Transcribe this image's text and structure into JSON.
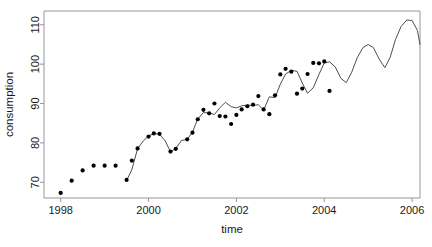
{
  "chart_data": {
    "type": "line",
    "title": "",
    "xlabel": "time",
    "ylabel": "consumption",
    "xlim": [
      1997.6,
      1998.0
    ],
    "xlim_actual": [
      1997.62,
      2006.18
    ],
    "ylim": [
      66.0,
      113.5
    ],
    "grid": false,
    "legend": "none",
    "y_ticks": [
      70,
      80,
      90,
      100,
      110
    ],
    "x_ticks": [
      1998,
      2000,
      2002,
      2004,
      2006
    ],
    "x_tick_labels": [
      "1998",
      "2000",
      "2002",
      "2004",
      "2006"
    ],
    "y_tick_labels": [
      "70",
      "80",
      "90",
      "100",
      "110"
    ],
    "series": [
      {
        "name": "observed",
        "type": "scatter",
        "marker": "filled-circle",
        "color": "#000000",
        "points": [
          [
            1998.0,
            67.3
          ],
          [
            1998.25,
            70.4
          ],
          [
            1998.5,
            73.0
          ],
          [
            1998.75,
            74.2
          ],
          [
            1999.0,
            74.2
          ],
          [
            1999.25,
            74.2
          ],
          [
            1999.5,
            70.6
          ],
          [
            1999.62,
            75.5
          ],
          [
            1999.75,
            78.6
          ],
          [
            2000.0,
            81.6
          ],
          [
            2000.12,
            82.4
          ],
          [
            2000.25,
            82.3
          ],
          [
            2000.5,
            77.8
          ],
          [
            2000.62,
            78.5
          ],
          [
            2000.88,
            80.9
          ],
          [
            2001.0,
            82.6
          ],
          [
            2001.12,
            86.0
          ],
          [
            2001.25,
            88.4
          ],
          [
            2001.38,
            87.5
          ],
          [
            2001.5,
            90.0
          ],
          [
            2001.62,
            86.8
          ],
          [
            2001.75,
            86.7
          ],
          [
            2001.88,
            84.8
          ],
          [
            2002.0,
            87.1
          ],
          [
            2002.12,
            88.5
          ],
          [
            2002.25,
            89.3
          ],
          [
            2002.38,
            89.7
          ],
          [
            2002.5,
            91.9
          ],
          [
            2002.62,
            88.5
          ],
          [
            2002.75,
            87.3
          ],
          [
            2002.88,
            92.1
          ],
          [
            2003.0,
            97.4
          ],
          [
            2003.12,
            98.8
          ],
          [
            2003.25,
            98.1
          ],
          [
            2003.38,
            92.5
          ],
          [
            2003.5,
            93.8
          ],
          [
            2003.62,
            97.5
          ],
          [
            2003.75,
            100.3
          ],
          [
            2003.88,
            100.2
          ],
          [
            2004.0,
            100.7
          ],
          [
            2004.12,
            93.2
          ]
        ]
      },
      {
        "name": "fitted-and-forecast",
        "type": "line",
        "color": "#3a3a3a",
        "points": [
          [
            1999.52,
            70.9
          ],
          [
            1999.62,
            73.2
          ],
          [
            1999.75,
            78.5
          ],
          [
            1999.88,
            80.5
          ],
          [
            2000.0,
            81.7
          ],
          [
            2000.12,
            82.4
          ],
          [
            2000.25,
            82.2
          ],
          [
            2000.38,
            80.5
          ],
          [
            2000.5,
            77.7
          ],
          [
            2000.62,
            78.6
          ],
          [
            2000.75,
            80.6
          ],
          [
            2000.88,
            80.9
          ],
          [
            2001.0,
            82.7
          ],
          [
            2001.12,
            86.1
          ],
          [
            2001.25,
            87.7
          ],
          [
            2001.38,
            87.6
          ],
          [
            2001.5,
            87.2
          ],
          [
            2001.62,
            88.9
          ],
          [
            2001.75,
            90.3
          ],
          [
            2001.88,
            89.2
          ],
          [
            2002.0,
            88.9
          ],
          [
            2002.12,
            89.4
          ],
          [
            2002.25,
            89.6
          ],
          [
            2002.38,
            89.5
          ],
          [
            2002.5,
            89.7
          ],
          [
            2002.62,
            88.3
          ],
          [
            2002.75,
            91.7
          ],
          [
            2002.88,
            91.5
          ],
          [
            2003.0,
            94.9
          ],
          [
            2003.12,
            97.5
          ],
          [
            2003.25,
            98.4
          ],
          [
            2003.38,
            98.2
          ],
          [
            2003.5,
            95.2
          ],
          [
            2003.62,
            92.6
          ],
          [
            2003.75,
            94.0
          ],
          [
            2003.88,
            97.4
          ],
          [
            2004.0,
            100.3
          ],
          [
            2004.12,
            100.6
          ],
          [
            2004.25,
            99.3
          ],
          [
            2004.38,
            96.4
          ],
          [
            2004.5,
            95.3
          ],
          [
            2004.62,
            97.8
          ],
          [
            2004.75,
            101.6
          ],
          [
            2004.88,
            104.2
          ],
          [
            2005.0,
            105.0
          ],
          [
            2005.12,
            104.2
          ],
          [
            2005.25,
            101.3
          ],
          [
            2005.38,
            99.1
          ],
          [
            2005.5,
            101.7
          ],
          [
            2005.62,
            106.2
          ],
          [
            2005.75,
            109.6
          ],
          [
            2005.88,
            111.2
          ],
          [
            2006.0,
            111.1
          ],
          [
            2006.12,
            108.6
          ],
          [
            2006.18,
            105.0
          ]
        ]
      }
    ]
  },
  "axes": {
    "x_axis_name": "time-axis",
    "y_axis_name": "consumption-axis"
  },
  "style": {
    "point_color": "#000000",
    "line_color": "#3a3a3a",
    "axis_color": "#8a8a8a",
    "text_color": "#1a1a1a",
    "background": "#ffffff",
    "point_radius": 2.1,
    "line_width": 0.9
  }
}
